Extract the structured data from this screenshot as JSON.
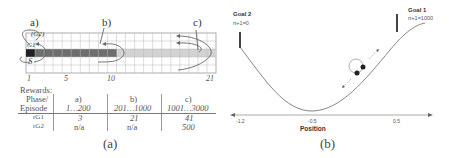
{
  "panel_a": {
    "caption": "(a)",
    "phase_markers": [
      "a)",
      "b)",
      "c)"
    ],
    "grid": {
      "columns": 21,
      "rows": 5,
      "start_label": "S",
      "goal1_label": "G1",
      "goal2_label": "(G2)",
      "x_ticks": [
        "1",
        "5",
        "10",
        "21"
      ],
      "dark_cell_color": "#2a2a2a",
      "phase_b_color": "#6e6e6e",
      "phase_c_color": "#c8c8c8"
    },
    "rewards_title": "Rewards:",
    "table": {
      "header_col": [
        "Phase/",
        "Episode"
      ],
      "phases": [
        "a)",
        "b)",
        "c)"
      ],
      "episodes": [
        "1…200",
        "201…1000",
        "1001…3000"
      ],
      "rows": [
        {
          "label": "rG1",
          "values": [
            "3",
            "21",
            "41"
          ]
        },
        {
          "label": "rG2",
          "values": [
            "n/a",
            "n/a",
            "500"
          ]
        }
      ]
    }
  },
  "panel_b": {
    "caption": "(b)",
    "goal1": {
      "title": "Goal 1",
      "reward": "rt+1=1000"
    },
    "goal2": {
      "title": "Goal 2",
      "reward": "rt+1=0"
    },
    "x_axis_label": "Position",
    "x_ticks": [
      "-1.2",
      "-0.5",
      "0.5"
    ]
  }
}
